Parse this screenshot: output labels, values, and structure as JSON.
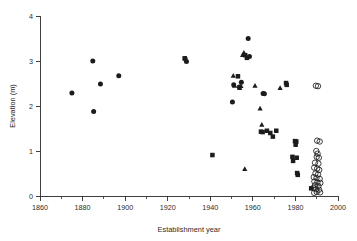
{
  "chart_data": {
    "type": "scatter",
    "title": "",
    "xlabel": "Establishment year",
    "ylabel": "Elevation (m)",
    "xlim": [
      1860,
      2000
    ],
    "ylim": [
      0,
      4
    ],
    "grid": false,
    "legend": "none",
    "x_ticks_major": [
      1860,
      1880,
      1900,
      1920,
      1940,
      1960,
      1980,
      2000
    ],
    "x_ticks_minor": [
      1870,
      1890,
      1910,
      1930,
      1950,
      1970,
      1990
    ],
    "y_ticks_major": [
      0,
      1,
      2,
      3,
      4
    ],
    "x_tick_labels": [
      "1860",
      "1880",
      "1900",
      "1920",
      "1940",
      "1960",
      "1980",
      "2000"
    ],
    "y_tick_labels": [
      "0",
      "1",
      "2",
      "3",
      "4"
    ],
    "marker_color": "#1c1c1c",
    "series": [
      {
        "name": "filled-circle",
        "marker": "circle",
        "filled": true,
        "points": [
          [
            1875.0,
            2.29
          ],
          [
            1884.8,
            3.0
          ],
          [
            1885.2,
            1.88
          ],
          [
            1888.4,
            2.49
          ],
          [
            1897.0,
            2.67
          ],
          [
            1928.2,
            3.05
          ],
          [
            1928.8,
            2.99
          ],
          [
            1950.4,
            2.09
          ],
          [
            1951.0,
            2.47
          ],
          [
            1953.6,
            2.42
          ],
          [
            1954.6,
            2.53
          ],
          [
            1957.8,
            3.5
          ],
          [
            1958.4,
            3.1
          ],
          [
            1964.8,
            2.28
          ],
          [
            1965.4,
            2.27
          ]
        ]
      },
      {
        "name": "filled-square",
        "marker": "square",
        "filled": true,
        "points": [
          [
            1928.0,
            3.06
          ],
          [
            1941.0,
            0.91
          ],
          [
            1953.0,
            2.66
          ],
          [
            1956.4,
            3.13
          ],
          [
            1957.2,
            3.07
          ],
          [
            1963.8,
            1.43
          ],
          [
            1964.6,
            1.42
          ],
          [
            1966.6,
            1.45
          ],
          [
            1968.2,
            1.4
          ],
          [
            1969.4,
            1.32
          ],
          [
            1971.0,
            1.45
          ],
          [
            1975.6,
            2.51
          ],
          [
            1975.9,
            2.47
          ],
          [
            1978.6,
            0.87
          ],
          [
            1978.9,
            0.78
          ],
          [
            1979.8,
            1.22
          ],
          [
            1980.1,
            1.14
          ],
          [
            1980.4,
            1.21
          ],
          [
            1980.6,
            0.85
          ],
          [
            1980.8,
            0.51
          ],
          [
            1981.1,
            0.47
          ],
          [
            1987.4,
            0.17
          ]
        ]
      },
      {
        "name": "filled-triangle",
        "marker": "triangle",
        "filled": true,
        "points": [
          [
            1950.8,
            2.67
          ],
          [
            1951.4,
            2.45
          ],
          [
            1953.8,
            2.4
          ],
          [
            1954.4,
            2.44
          ],
          [
            1955.2,
            3.13
          ],
          [
            1955.8,
            3.18
          ],
          [
            1956.2,
            0.6
          ],
          [
            1961.0,
            2.45
          ],
          [
            1963.4,
            1.94
          ],
          [
            1964.2,
            1.58
          ],
          [
            1972.8,
            2.4
          ]
        ]
      },
      {
        "name": "open-circle",
        "marker": "circle",
        "filled": false,
        "points": [
          [
            1989.6,
            2.45
          ],
          [
            1990.6,
            2.44
          ],
          [
            1990.2,
            1.23
          ],
          [
            1991.4,
            1.21
          ],
          [
            1989.8,
            1.0
          ],
          [
            1990.4,
            0.94
          ],
          [
            1990.0,
            0.87
          ],
          [
            1991.0,
            0.85
          ],
          [
            1989.2,
            0.74
          ],
          [
            1990.8,
            0.72
          ],
          [
            1988.8,
            0.63
          ],
          [
            1990.2,
            0.61
          ],
          [
            1991.2,
            0.58
          ],
          [
            1989.4,
            0.5
          ],
          [
            1990.6,
            0.48
          ],
          [
            1988.6,
            0.42
          ],
          [
            1989.9,
            0.4
          ],
          [
            1991.4,
            0.38
          ],
          [
            1988.9,
            0.32
          ],
          [
            1990.3,
            0.3
          ],
          [
            1991.7,
            0.29
          ],
          [
            1989.2,
            0.24
          ],
          [
            1990.8,
            0.22
          ],
          [
            1988.4,
            0.18
          ],
          [
            1989.7,
            0.15
          ],
          [
            1991.1,
            0.14
          ],
          [
            1990.0,
            0.09
          ],
          [
            1991.6,
            0.08
          ],
          [
            1988.8,
            0.07
          ]
        ]
      }
    ]
  }
}
